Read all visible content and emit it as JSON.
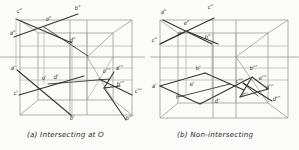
{
  "figure": {
    "kind": "descriptive-geometry-orthographic-projection-plate",
    "background_color": "#fbfbfa",
    "ink_color": "#2b2b2b",
    "construction_line_color": "#8d8d8d",
    "width": 299,
    "height": 150
  },
  "captions": {
    "left": "(a) Intersecting at O",
    "right": "(b) Non-intersecting"
  },
  "panels": [
    {
      "id": "panel-a",
      "caption": "(a) Intersecting at O",
      "description": "Two straight lines AB and CD intersecting at point O, projected on three planes",
      "labels": [
        {
          "text": "c\"",
          "x": 17,
          "y": 13
        },
        {
          "text": "b\"",
          "x": 75,
          "y": 10
        },
        {
          "text": "o\"",
          "x": 46,
          "y": 21
        },
        {
          "text": "a\"",
          "x": 10,
          "y": 35
        },
        {
          "text": "d\"",
          "x": 70,
          "y": 42
        },
        {
          "text": "a'",
          "x": 11,
          "y": 70
        },
        {
          "text": "o'",
          "x": 42,
          "y": 80
        },
        {
          "text": "d'",
          "x": 54,
          "y": 79
        },
        {
          "text": "c'",
          "x": 14,
          "y": 95
        },
        {
          "text": "o'''",
          "x": 103,
          "y": 73
        },
        {
          "text": "a'''",
          "x": 116,
          "y": 70
        },
        {
          "text": "b'''",
          "x": 117,
          "y": 86
        },
        {
          "text": "c'''",
          "x": 135,
          "y": 93
        },
        {
          "text": "b'",
          "x": 70,
          "y": 120
        },
        {
          "text": "b'''",
          "x": 126,
          "y": 120
        }
      ]
    },
    {
      "id": "panel-b",
      "caption": "(b) Non-intersecting",
      "description": "Two straight lines that appear to cross in the views but do not intersect in space",
      "labels": [
        {
          "text": "a\"",
          "x": 161,
          "y": 14
        },
        {
          "text": "c\"",
          "x": 208,
          "y": 9
        },
        {
          "text": "e\"",
          "x": 184,
          "y": 25
        },
        {
          "text": "f\"",
          "x": 178,
          "y": 36
        },
        {
          "text": "c\"",
          "x": 152,
          "y": 42
        },
        {
          "text": "b\"",
          "x": 205,
          "y": 39
        },
        {
          "text": "b'",
          "x": 196,
          "y": 70
        },
        {
          "text": "b'''",
          "x": 250,
          "y": 70
        },
        {
          "text": "a'",
          "x": 152,
          "y": 88
        },
        {
          "text": "e'",
          "x": 190,
          "y": 86
        },
        {
          "text": "c'''",
          "x": 236,
          "y": 83
        },
        {
          "text": "e'''",
          "x": 259,
          "y": 80
        },
        {
          "text": "f'",
          "x": 176,
          "y": 99
        },
        {
          "text": "a'''",
          "x": 266,
          "y": 89
        },
        {
          "text": "d'",
          "x": 215,
          "y": 103
        },
        {
          "text": "f'''",
          "x": 242,
          "y": 97
        },
        {
          "text": "d'''",
          "x": 273,
          "y": 101
        }
      ]
    }
  ],
  "reference_line": {
    "name": "xy-ground-line",
    "y": 57
  }
}
